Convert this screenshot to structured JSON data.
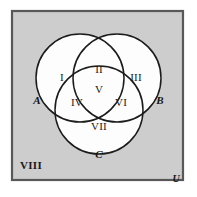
{
  "figure": {
    "type": "venn-diagram-three-set",
    "background_color": "#cacaca",
    "page_color": "#ffffff",
    "circle_fill": "#fdfdfd",
    "stroke_color": "#1c1c1c",
    "frame_stroke_color": "#585858"
  },
  "universe": {
    "label": "U",
    "outside_region_label": "VIII",
    "frame": {
      "x": 12,
      "y": 11,
      "width": 171,
      "height": 169
    }
  },
  "sets": [
    {
      "name": "set-a",
      "label": "A",
      "cx": 80,
      "cy": 78,
      "r": 44,
      "label_x": 37,
      "label_y": 101
    },
    {
      "name": "set-b",
      "label": "B",
      "cx": 117,
      "cy": 78,
      "r": 44,
      "label_x": 160,
      "label_y": 101
    },
    {
      "name": "set-c",
      "label": "C",
      "cx": 99,
      "cy": 110,
      "r": 44,
      "label_x": 99,
      "label_y": 155
    }
  ],
  "regions": [
    {
      "name": "region-a-only",
      "label": "I",
      "x": 62,
      "y": 78,
      "sets": "A only"
    },
    {
      "name": "region-a-b",
      "label": "II",
      "x": 99,
      "y": 70,
      "sets": "A and B"
    },
    {
      "name": "region-b-only",
      "label": "III",
      "x": 136,
      "y": 78,
      "sets": "B only"
    },
    {
      "name": "region-a-c",
      "label": "IV",
      "x": 77,
      "y": 103,
      "sets": "A and C"
    },
    {
      "name": "region-a-b-c",
      "label": "V",
      "x": 99,
      "y": 90,
      "sets": "A and B and C"
    },
    {
      "name": "region-b-c",
      "label": "VI",
      "x": 121,
      "y": 103,
      "sets": "B and C"
    },
    {
      "name": "region-c-only",
      "label": "VII",
      "x": 99,
      "y": 127,
      "sets": "C only"
    },
    {
      "name": "region-complement",
      "label": "VIII",
      "x": 20,
      "y": 166,
      "sets": "outside all sets"
    }
  ],
  "universe_label_position": {
    "x": 176,
    "y": 180
  }
}
